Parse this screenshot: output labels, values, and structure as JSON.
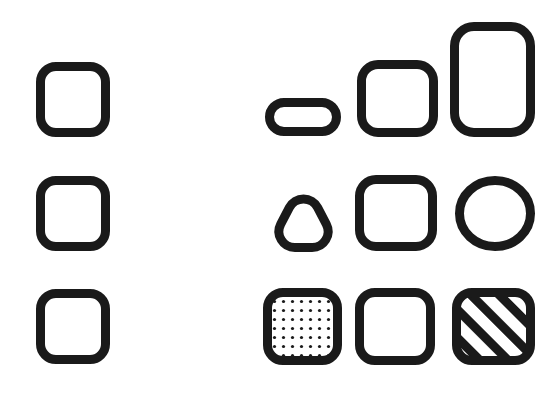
{
  "figure": {
    "background_color": "#ffffff",
    "stroke_color": "#1a1a1a",
    "stroke_width": 9,
    "width": 560,
    "height": 397
  },
  "rows": [
    {
      "id": "row-size",
      "label": "Size variation row",
      "reference": {
        "name": "reference-rounded-square-top",
        "shape": "rounded-square",
        "x": 36,
        "y": 62,
        "width": 74,
        "height": 75,
        "radius": 20,
        "fill": "none"
      },
      "variants": [
        {
          "name": "pill-small",
          "shape": "pill",
          "x": 265,
          "y": 98,
          "width": 76,
          "height": 38,
          "radius": 19,
          "fill": "none"
        },
        {
          "name": "rounded-square-medium",
          "shape": "rounded-square",
          "x": 357,
          "y": 60,
          "width": 81,
          "height": 77,
          "radius": 21,
          "fill": "none"
        },
        {
          "name": "rounded-rect-tall",
          "shape": "rounded-rect",
          "x": 450,
          "y": 22,
          "width": 85,
          "height": 115,
          "radius": 24,
          "fill": "none"
        }
      ]
    },
    {
      "id": "row-shape",
      "label": "Shape variation row",
      "reference": {
        "name": "reference-rounded-square-middle",
        "shape": "rounded-square",
        "x": 36,
        "y": 176,
        "width": 74,
        "height": 75,
        "radius": 20,
        "fill": "none"
      },
      "variants": [
        {
          "name": "rounded-triangle",
          "shape": "rounded-triangle",
          "x": 264,
          "y": 176,
          "width": 79,
          "height": 76,
          "radius": 16,
          "fill": "none"
        },
        {
          "name": "rounded-square-plain",
          "shape": "rounded-square",
          "x": 355,
          "y": 175,
          "width": 82,
          "height": 76,
          "radius": 21,
          "fill": "none"
        },
        {
          "name": "circle",
          "shape": "circle",
          "x": 455,
          "y": 176,
          "width": 80,
          "height": 75,
          "radius": 40,
          "fill": "none"
        }
      ]
    },
    {
      "id": "row-fill",
      "label": "Fill pattern variation row",
      "reference": {
        "name": "reference-rounded-square-bottom",
        "shape": "rounded-square",
        "x": 36,
        "y": 289,
        "width": 74,
        "height": 75,
        "radius": 20,
        "fill": "none"
      },
      "variants": [
        {
          "name": "rounded-square-dotted",
          "shape": "rounded-square",
          "x": 263,
          "y": 288,
          "width": 79,
          "height": 77,
          "radius": 20,
          "fill": "dots"
        },
        {
          "name": "rounded-square-empty",
          "shape": "rounded-square",
          "x": 355,
          "y": 288,
          "width": 80,
          "height": 77,
          "radius": 20,
          "fill": "none"
        },
        {
          "name": "rounded-square-hatched",
          "shape": "rounded-square",
          "x": 452,
          "y": 288,
          "width": 83,
          "height": 77,
          "radius": 20,
          "fill": "diagonal-hatch"
        }
      ]
    }
  ],
  "patterns": {
    "dots": {
      "name": "dot-fill-pattern",
      "dot_color": "#1a1a1a",
      "dot_radius": 1.6,
      "spacing": 9
    },
    "hatch": {
      "name": "diagonal-hatch-pattern",
      "line_color": "#1a1a1a",
      "line_width": 9,
      "angle_degrees": 45,
      "spacing": 20
    }
  }
}
